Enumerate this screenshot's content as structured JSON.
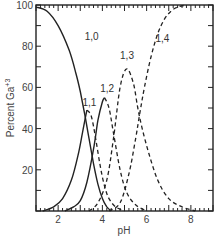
{
  "chart_data": {
    "type": "line",
    "title": "",
    "xlabel": "pH",
    "ylabel": "Percent Ga+3",
    "ylabel_main": "Percent Ga",
    "ylabel_sup": "+3",
    "xlim": [
      1,
      9
    ],
    "ylim": [
      0,
      100
    ],
    "x_ticks": [
      2,
      4,
      6,
      8
    ],
    "y_ticks": [
      20,
      40,
      60,
      80,
      100
    ],
    "grid": false,
    "legend": "inline curve labels",
    "series": [
      {
        "name": "1,0",
        "style": "solid",
        "x": [
          1.0,
          1.5,
          2.0,
          2.5,
          2.8,
          3.0,
          3.2,
          3.4,
          3.6,
          3.8,
          4.0,
          4.2,
          4.4
        ],
        "y": [
          99,
          97,
          90,
          78,
          67,
          58,
          47,
          35,
          23,
          13,
          6,
          2,
          0
        ]
      },
      {
        "name": "1,1",
        "style": "solid rising, dashed falling",
        "x": [
          1.3,
          1.8,
          2.2,
          2.6,
          2.9,
          3.1,
          3.3,
          3.5,
          3.7,
          3.9,
          4.1,
          4.3,
          4.6,
          5.0
        ],
        "y": [
          0,
          2,
          6,
          15,
          27,
          38,
          49,
          46,
          35,
          22,
          12,
          6,
          2,
          0
        ]
      },
      {
        "name": "1,2",
        "style": "solid rising, dashed falling",
        "x": [
          2.3,
          2.7,
          3.0,
          3.3,
          3.6,
          3.8,
          4.0,
          4.1,
          4.3,
          4.5,
          4.8,
          5.1,
          5.5,
          6.0
        ],
        "y": [
          0,
          2,
          5,
          14,
          30,
          44,
          53,
          55,
          50,
          38,
          20,
          9,
          3,
          0
        ]
      },
      {
        "name": "1,3",
        "style": "dashed",
        "x": [
          3.4,
          3.8,
          4.2,
          4.5,
          4.8,
          5.1,
          5.4,
          5.6,
          5.8,
          6.1,
          6.5,
          7.0,
          7.6,
          8.2
        ],
        "y": [
          0,
          4,
          15,
          35,
          60,
          69,
          62,
          50,
          40,
          28,
          15,
          6,
          2,
          0
        ]
      },
      {
        "name": "1,4",
        "style": "dashed",
        "x": [
          4.3,
          4.8,
          5.2,
          5.5,
          5.7,
          5.9,
          6.2,
          6.5,
          6.8,
          7.1,
          7.4,
          7.8
        ],
        "y": [
          0,
          4,
          18,
          35,
          48,
          60,
          75,
          86,
          93,
          97,
          99,
          100
        ]
      }
    ],
    "annotations": [
      {
        "text": "1,0",
        "x": 3.2,
        "y": 83
      },
      {
        "text": "1,1",
        "x": 3.1,
        "y": 51
      },
      {
        "text": "1,2",
        "x": 3.9,
        "y": 58
      },
      {
        "text": "1,3",
        "x": 4.8,
        "y": 74
      },
      {
        "text": "1,4",
        "x": 6.4,
        "y": 82
      }
    ]
  }
}
